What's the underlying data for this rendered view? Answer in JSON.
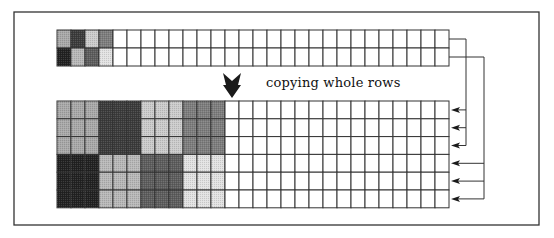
{
  "caption": "copying whole rows",
  "frame": {
    "x": 14,
    "y": 12,
    "w": 525,
    "h": 213,
    "stroke": "#333333"
  },
  "grid": {
    "cell_w": 14,
    "stroke": "#333333",
    "top": {
      "x": 57,
      "y": 30,
      "cols": 28,
      "rows": 2,
      "row_h": 18,
      "filled": [
        [
          "#a9a9a9",
          "#3c3c3c",
          "#cccccc",
          "#7e7e7e"
        ],
        [
          "#222222",
          "#b8b8b8",
          "#5e5e5e",
          "#e2e2e2"
        ]
      ]
    },
    "bottom": {
      "x": 57,
      "y": 101,
      "cols": 28,
      "rows": 6,
      "row_h": 17.8,
      "block": 3
    }
  },
  "down_arrow": {
    "cx": 232,
    "top": 73,
    "bottom": 98,
    "color": "#1a1a1a"
  },
  "connectors": [
    {
      "from_row": 0,
      "bus_x": 466,
      "targets": [
        0,
        1,
        2
      ]
    },
    {
      "from_row": 1,
      "bus_x": 484,
      "targets": [
        3,
        4,
        5
      ]
    }
  ]
}
